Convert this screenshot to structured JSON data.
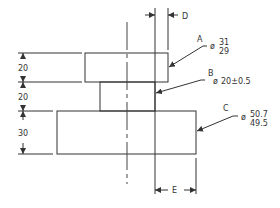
{
  "drawing": {
    "type": "engineering-dimension-drawing",
    "vertical_dims": [
      {
        "id": "dim-top",
        "value": "20"
      },
      {
        "id": "dim-mid",
        "value": "20"
      },
      {
        "id": "dim-bottom",
        "value": "30"
      }
    ],
    "labels": {
      "A": {
        "letter": "A",
        "symbol": "ø",
        "upper": "31",
        "lower": "29"
      },
      "B": {
        "letter": "B",
        "symbol": "ø",
        "value": "20±0.5"
      },
      "C": {
        "letter": "C",
        "symbol": "ø",
        "upper": "50.7",
        "lower": "49.5"
      },
      "D": {
        "letter": "D"
      },
      "E": {
        "letter": "E"
      }
    },
    "stroke_color": "#333333",
    "background": "#ffffff"
  }
}
